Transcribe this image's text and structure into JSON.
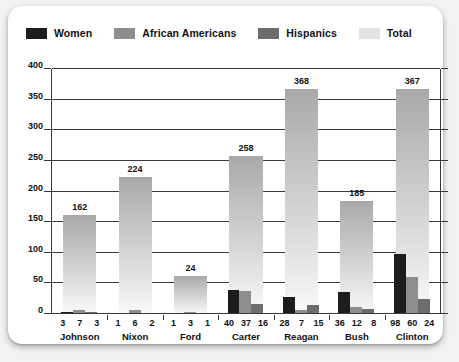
{
  "legend": {
    "items": [
      {
        "label": "Women",
        "color": "#1c1c1c",
        "icon": "legend-swatch-icon"
      },
      {
        "label": "African Americans",
        "color": "#8e8e8e",
        "icon": "legend-swatch-icon"
      },
      {
        "label": "Hispanics",
        "color": "#6d6d6d",
        "icon": "legend-swatch-icon"
      },
      {
        "label": "Total",
        "color": "#e3e3e3",
        "icon": "legend-swatch-icon"
      }
    ]
  },
  "chart_data": {
    "type": "bar",
    "title": "",
    "subtitle": "",
    "xlabel": "",
    "ylabel": "",
    "ylim": [
      0,
      400
    ],
    "yticks": [
      0,
      50,
      100,
      150,
      200,
      250,
      300,
      350,
      400
    ],
    "ytick_labels": [
      "0",
      "50",
      "100",
      "150",
      "200",
      "250",
      "300",
      "350",
      "400"
    ],
    "grid": true,
    "legend_position": "top-left",
    "categories": [
      "Johnson",
      "Nixon",
      "Ford",
      "Carter",
      "Reagan",
      "Bush",
      "Clinton"
    ],
    "series": [
      {
        "name": "Women",
        "color": "#1c1c1c",
        "values": [
          3,
          1,
          1,
          40,
          28,
          36,
          98
        ]
      },
      {
        "name": "African Americans",
        "color": "#8e8e8e",
        "values": [
          7,
          6,
          3,
          37,
          7,
          12,
          60
        ]
      },
      {
        "name": "Hispanics",
        "color": "#6d6d6d",
        "values": [
          3,
          2,
          1,
          16,
          15,
          8,
          24
        ]
      },
      {
        "name": "Total",
        "color": "#c9c9c9",
        "values": [
          162,
          224,
          62,
          258,
          368,
          185,
          367
        ]
      }
    ],
    "total_labels": [
      "162",
      "224",
      "24",
      "258",
      "368",
      "185",
      "367"
    ],
    "group_value_labels": [
      [
        "3",
        "7",
        "3"
      ],
      [
        "1",
        "6",
        "2"
      ],
      [
        "1",
        "3",
        "1"
      ],
      [
        "40",
        "37",
        "16"
      ],
      [
        "28",
        "7",
        "15"
      ],
      [
        "36",
        "12",
        "8"
      ],
      [
        "98",
        "60",
        "24"
      ]
    ]
  }
}
